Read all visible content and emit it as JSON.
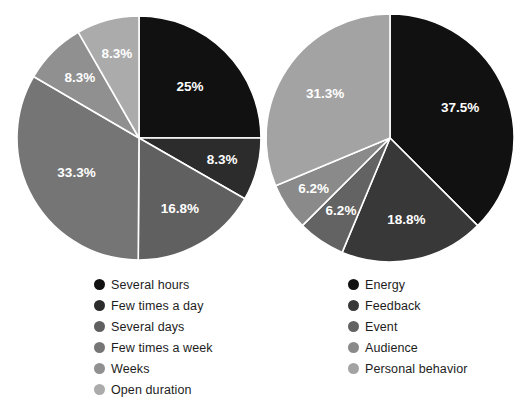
{
  "figure": {
    "background": "#ffffff",
    "width": 523,
    "height": 414
  },
  "chart_data": [
    {
      "type": "pie",
      "title": "",
      "panel": "left",
      "start_angle_deg": 0,
      "direction": "clockwise",
      "label_color": "#ffffff",
      "separator_color": "#ffffff",
      "legend_position": "bottom",
      "categories": [
        "Several hours",
        "Few times a day",
        "Several days",
        "Few times a week",
        "Weeks",
        "Open duration"
      ],
      "values": [
        25,
        8.3,
        16.8,
        33.3,
        8.3,
        8.3
      ],
      "labels": [
        "25%",
        "8.3%",
        "16.8%",
        "33.3%",
        "8.3%",
        "8.3%"
      ],
      "colors": [
        "#111111",
        "#2c2c2c",
        "#606060",
        "#757575",
        "#909090",
        "#ababab"
      ]
    },
    {
      "type": "pie",
      "title": "",
      "panel": "right",
      "start_angle_deg": 0,
      "direction": "clockwise",
      "label_color": "#ffffff",
      "separator_color": "#ffffff",
      "legend_position": "bottom",
      "categories": [
        "Energy",
        "Feedback",
        "Event",
        "Audience",
        "Personal behavior"
      ],
      "values": [
        37.5,
        18.8,
        6.2,
        6.2,
        31.3
      ],
      "labels": [
        "37.5%",
        "18.8%",
        "6.2%",
        "6.2%",
        "31.3%"
      ],
      "colors": [
        "#111111",
        "#383838",
        "#636363",
        "#8a8a8a",
        "#a3a3a3"
      ]
    }
  ],
  "left_chart": {
    "legend": {
      "items": [
        {
          "label": "Several hours",
          "color": "#111111"
        },
        {
          "label": "Few times a day",
          "color": "#2c2c2c"
        },
        {
          "label": "Several days",
          "color": "#606060"
        },
        {
          "label": "Few times a week",
          "color": "#757575"
        },
        {
          "label": "Weeks",
          "color": "#909090"
        },
        {
          "label": "Open duration",
          "color": "#ababab"
        }
      ]
    },
    "slice_labels": [
      "25%",
      "8.3%",
      "16.8%",
      "33.3%",
      "8.3%",
      "8.3%"
    ]
  },
  "right_chart": {
    "legend": {
      "items": [
        {
          "label": "Energy",
          "color": "#111111"
        },
        {
          "label": "Feedback",
          "color": "#383838"
        },
        {
          "label": "Event",
          "color": "#636363"
        },
        {
          "label": "Audience",
          "color": "#8a8a8a"
        },
        {
          "label": "Personal behavior",
          "color": "#a3a3a3"
        }
      ]
    },
    "slice_labels": [
      "37.5%",
      "18.8%",
      "6.2%",
      "6.2%",
      "31.3%"
    ]
  }
}
